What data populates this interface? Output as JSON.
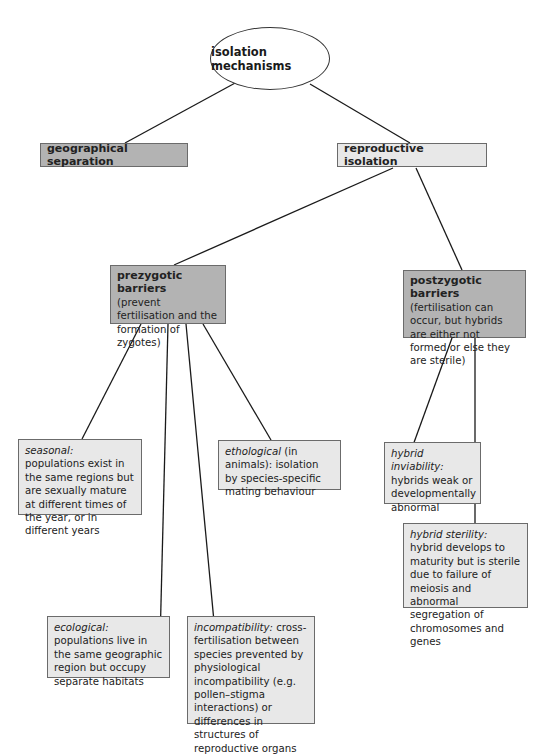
{
  "root": {
    "label": "isolation mechanisms"
  },
  "level1": {
    "geographical": {
      "label": "geographical separation"
    },
    "reproductive": {
      "label": "reproductive isolation"
    }
  },
  "level2": {
    "prezygotic": {
      "heading": "prezygotic barriers",
      "description": "(prevent fertilisation and the formation of zygotes)"
    },
    "postzygotic": {
      "heading": "postzygotic barriers",
      "description": "(fertilisation can occur, but hybrids are either not formed or else they are sterile)"
    }
  },
  "prezygotic_types": {
    "seasonal": {
      "term": "seasonal:",
      "description": " populations exist in the same regions but are sexually mature at different times of the year, or in different years"
    },
    "ethological": {
      "term": "ethological",
      "description": " (in animals): isolation by species-specific mating behaviour"
    },
    "ecological": {
      "term": "ecological:",
      "description": " populations live in the same geographic region but occupy separate habitats"
    },
    "incompatibility": {
      "term": "incompatibility:",
      "description": " cross-fertilisation between species prevented by physiological incompatibility (e.g. pollen–stigma interactions) or differences in structures of reproductive organs"
    }
  },
  "postzygotic_types": {
    "inviability": {
      "term": "hybrid inviability:",
      "description": " hybrids weak or developmentally abnormal"
    },
    "sterility": {
      "term": "hybrid sterility:",
      "description": " hybrid develops to maturity but is sterile due to failure of meiosis and abnormal segregation of chromosomes and genes"
    }
  },
  "colors": {
    "dark_box": "#b3b3b3",
    "light_box": "#e8e8e8",
    "line": "#1a1a1a"
  }
}
